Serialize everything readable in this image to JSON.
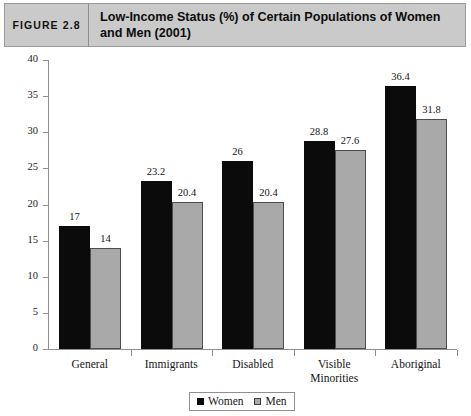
{
  "figure": {
    "number_label": "FIGURE 2.8",
    "title": "Low-Income Status (%) of Certain Populations of Women and Men (2001)"
  },
  "chart_data": {
    "type": "bar",
    "title": "Low-Income Status (%) of Certain Populations of Women and Men (2001)",
    "xlabel": "",
    "ylabel": "",
    "ylim": [
      0,
      40
    ],
    "yticks": [
      0,
      5,
      10,
      15,
      20,
      25,
      30,
      35,
      40
    ],
    "ytick_labels": [
      "0",
      "5",
      "10",
      "15",
      "20",
      "25",
      "30",
      "35",
      "40"
    ],
    "grid": false,
    "legend_position": "bottom-center",
    "categories": [
      "General",
      "Immigrants",
      "Disabled",
      "Visible Minorities",
      "Aboriginal"
    ],
    "category_lines": [
      [
        "General"
      ],
      [
        "Immigrants"
      ],
      [
        "Disabled"
      ],
      [
        "Visible",
        "Minorities"
      ],
      [
        "Aboriginal"
      ]
    ],
    "series": [
      {
        "name": "Women",
        "color": "#0b0b0b",
        "values": [
          17,
          23.2,
          26,
          28.8,
          36.4
        ],
        "labels": [
          "17",
          "23.2",
          "26",
          "28.8",
          "36.4"
        ]
      },
      {
        "name": "Men",
        "color": "#a9a9a9",
        "values": [
          14,
          20.4,
          20.4,
          27.6,
          31.8
        ],
        "labels": [
          "14",
          "20.4",
          "20.4",
          "27.6",
          "31.8"
        ]
      }
    ]
  },
  "colors": {
    "header_band": "#cacaca",
    "frame_border": "#9b9b9b",
    "axis": "#8f8f8f",
    "women_bar": "#0b0b0b",
    "men_bar": "#a9a9a9",
    "page_background": "#ffffff"
  }
}
